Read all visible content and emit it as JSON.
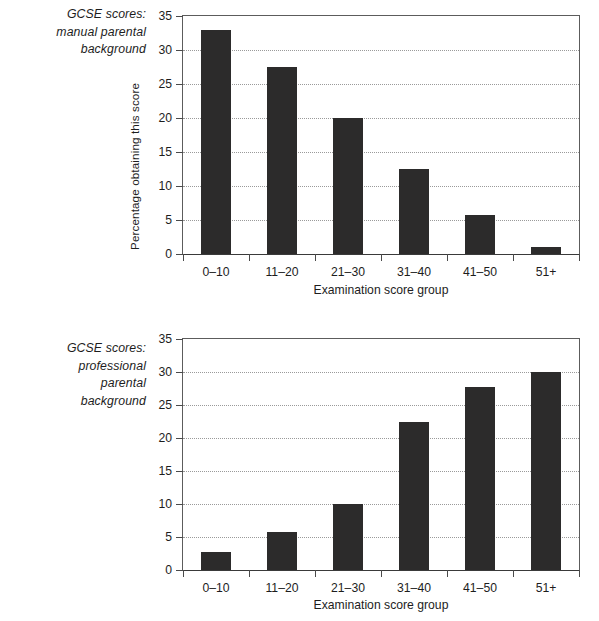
{
  "chart_data": [
    {
      "type": "bar",
      "title": "GCSE scores: manual parental background",
      "caption": "GCSE scores:\nmanual parental\nbackground",
      "categories": [
        "0–10",
        "11–20",
        "21–30",
        "31–40",
        "41–50",
        "51+"
      ],
      "values": [
        33,
        27.5,
        20,
        12.5,
        5.8,
        1
      ],
      "xlabel": "Examination score group",
      "ylabel": "Percentage obtaining this score",
      "ylim": [
        0,
        35
      ],
      "yticks": [
        0,
        5,
        10,
        15,
        20,
        25,
        30,
        35
      ],
      "ytick_labels": [
        "0",
        "5",
        "10",
        "15",
        "20",
        "25",
        "30",
        "35"
      ],
      "grid": true,
      "grid_style": "dotted-horizontal",
      "legend": null,
      "bar_color": "#2c2b2b",
      "axis_color": "#4a4a4a",
      "grid_color": "#9a9a9a"
    },
    {
      "type": "bar",
      "title": "GCSE scores: professional parental background",
      "caption": "GCSE scores:\nprofessional\nparental\nbackground",
      "categories": [
        "0–10",
        "11–20",
        "21–30",
        "31–40",
        "41–50",
        "51+"
      ],
      "values": [
        2.7,
        5.7,
        10,
        22.5,
        27.8,
        30
      ],
      "xlabel": "Examination score group",
      "ylabel": "Percentage obtaining this score",
      "ylim": [
        0,
        35
      ],
      "yticks": [
        0,
        5,
        10,
        15,
        20,
        25,
        30,
        35
      ],
      "ytick_labels": [
        "0",
        "5",
        "10",
        "15",
        "20",
        "25",
        "30",
        "35"
      ],
      "grid": true,
      "grid_style": "dotted-horizontal",
      "legend": null,
      "bar_color": "#2c2b2b",
      "axis_color": "#4a4a4a",
      "grid_color": "#9a9a9a"
    }
  ]
}
